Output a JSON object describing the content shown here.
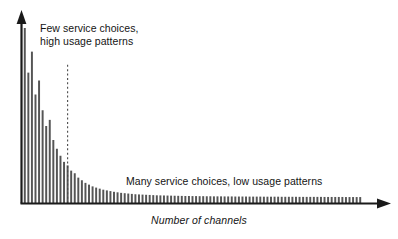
{
  "figure": {
    "background_color": "#ffffff",
    "width": 398,
    "height": 239
  },
  "annotations": {
    "head_line1": "Few service choices,",
    "head_line2": "high usage patterns",
    "tail": "Many service choices, low usage patterns"
  },
  "axis": {
    "x_label": "Number of channels",
    "y_label": ""
  },
  "chart_data": {
    "type": "bar",
    "title": "",
    "subtitle": "",
    "xlabel": "Number of channels",
    "ylabel": "",
    "grid": false,
    "legend": false,
    "legend_position": "none",
    "axis_style": "arrow-headed L-shaped axes, no tick marks, no tick labels",
    "bar_color": "#555555",
    "axis_color": "#1a1a1a",
    "annotation_color": "#141414",
    "xlim": [
      0,
      96
    ],
    "ylim": [
      0,
      100
    ],
    "annotations_list": [
      {
        "text": "Few service choices, high usage patterns",
        "x": 8,
        "y": 92,
        "points_to": "left head of distribution"
      },
      {
        "text": "Many service choices, low usage patterns",
        "x": 48,
        "y": 18,
        "points_to": "right tail of distribution"
      }
    ],
    "reference_lines": [
      {
        "type": "vertical",
        "style": "dashed",
        "x": 12,
        "y_from": 0,
        "y_to": 79,
        "color": "#4a4a4a",
        "label": ""
      }
    ],
    "categories": [
      1,
      2,
      3,
      4,
      5,
      6,
      7,
      8,
      9,
      10,
      11,
      12,
      13,
      14,
      15,
      16,
      17,
      18,
      19,
      20,
      21,
      22,
      23,
      24,
      25,
      26,
      27,
      28,
      29,
      30,
      31,
      32,
      33,
      34,
      35,
      36,
      37,
      38,
      39,
      40,
      41,
      42,
      43,
      44,
      45,
      46,
      47,
      48,
      49,
      50,
      51,
      52,
      53,
      54,
      55,
      56,
      57,
      58,
      59,
      60,
      61,
      62,
      63,
      64,
      65,
      66,
      67,
      68,
      69,
      70,
      71,
      72,
      73,
      74,
      75,
      76,
      77,
      78,
      79,
      80,
      81,
      82,
      83,
      84,
      85,
      86,
      87,
      88,
      89,
      90,
      91,
      92,
      93,
      94,
      95
    ],
    "values": [
      100.0,
      74.5,
      86.5,
      62.0,
      70.0,
      53.0,
      44.0,
      47.5,
      36.0,
      31.0,
      27.0,
      23.5,
      21.5,
      18.5,
      17.0,
      14.5,
      13.0,
      11.5,
      10.5,
      9.5,
      8.8,
      8.2,
      7.6,
      7.2,
      6.8,
      6.4,
      6.1,
      5.8,
      5.6,
      5.4,
      5.2,
      5.0,
      4.9,
      4.8,
      4.7,
      4.6,
      4.5,
      4.4,
      4.35,
      4.3,
      4.25,
      4.2,
      4.15,
      4.1,
      4.05,
      4.0,
      4.0,
      3.95,
      3.95,
      3.9,
      3.9,
      3.85,
      3.85,
      3.8,
      3.8,
      3.8,
      3.75,
      3.75,
      3.75,
      3.7,
      3.7,
      3.7,
      3.7,
      3.65,
      3.65,
      3.65,
      3.65,
      3.6,
      3.6,
      3.6,
      3.6,
      3.6,
      3.55,
      3.55,
      3.55,
      3.55,
      3.55,
      3.5,
      3.5,
      3.5,
      3.5,
      3.5,
      3.5,
      3.5,
      3.45,
      3.45,
      3.45,
      3.45,
      3.45,
      3.45,
      3.4,
      3.4,
      3.4,
      3.4,
      3.4
    ]
  }
}
